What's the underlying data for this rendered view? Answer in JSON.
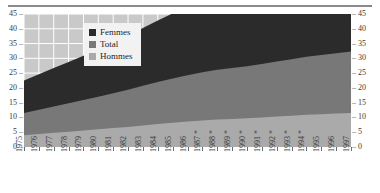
{
  "chart_data": {
    "type": "area",
    "title": "",
    "subtitle": "",
    "xlabel": "",
    "ylabel": "",
    "ylim": [
      0,
      45
    ],
    "yticks": [
      0,
      5,
      10,
      15,
      20,
      25,
      30,
      35,
      40,
      45
    ],
    "ytick_labels": [
      "0",
      "5",
      "10",
      "15",
      "20",
      "25",
      "30",
      "35",
      "40",
      "45"
    ],
    "grid": true,
    "legend_position": "top-center",
    "stacked": true,
    "dual_axis": true,
    "categories": [
      "1975",
      "1976",
      "1977",
      "1978",
      "1979",
      "1980",
      "1981",
      "1982",
      "1983",
      "1984",
      "1985",
      "1986",
      "1987 *",
      "1988 *",
      "1989 *",
      "1990 *",
      "1991 *",
      "1992 *",
      "1993 *",
      "1994 *",
      "1995",
      "1996",
      "1997"
    ],
    "categories_plain": [
      "1975",
      "1976",
      "1977",
      "1978",
      "1979",
      "1980",
      "1981",
      "1982",
      "1983",
      "1984",
      "1985",
      "1986",
      "1987",
      "1988",
      "1989",
      "1990",
      "1991",
      "1992",
      "1993",
      "1994",
      "1995",
      "1996",
      "1997"
    ],
    "footnote_marker": "*",
    "series": [
      {
        "name": "Hommes",
        "color": "#aaaaaa",
        "values": [
          4.0,
          4.4,
          4.8,
          5.2,
          5.6,
          6.0,
          6.4,
          6.8,
          7.3,
          7.8,
          8.2,
          8.6,
          9.0,
          9.3,
          9.5,
          9.7,
          10.0,
          10.3,
          10.6,
          10.9,
          11.1,
          11.3,
          11.5
        ]
      },
      {
        "name": "Total",
        "color": "#787878",
        "values": [
          7.5,
          8.2,
          8.9,
          9.6,
          10.3,
          11.0,
          11.8,
          12.6,
          13.4,
          14.2,
          15.0,
          15.7,
          16.3,
          16.8,
          17.2,
          17.6,
          18.1,
          18.6,
          19.1,
          19.6,
          20.0,
          20.4,
          20.8
        ]
      },
      {
        "name": "Femmes",
        "color": "#2b2b2b",
        "values": [
          11.0,
          12.0,
          13.0,
          14.0,
          15.0,
          16.0,
          17.2,
          18.4,
          19.6,
          20.8,
          22.0,
          22.8,
          23.4,
          23.8,
          24.0,
          24.2,
          24.4,
          24.4,
          24.3,
          24.3,
          24.6,
          25.2,
          26.2
        ]
      }
    ],
    "legend_order": [
      "Femmes",
      "Total",
      "Hommes"
    ],
    "plot_background": "#c9c9c9",
    "gridline_color": "#ffffff"
  },
  "legend": {
    "items": [
      {
        "label": "Femmes",
        "color": "#2b2b2b"
      },
      {
        "label": "Total",
        "color": "#787878"
      },
      {
        "label": "Hommes",
        "color": "#aaaaaa"
      }
    ]
  },
  "colors": {
    "femmes": "#2b2b2b",
    "total": "#787878",
    "hommes": "#aaaaaa",
    "plot_bg": "#c9c9c9",
    "grid": "#ffffff",
    "axis_text": "#3a3a3a",
    "rule": "#8a8a8a"
  }
}
